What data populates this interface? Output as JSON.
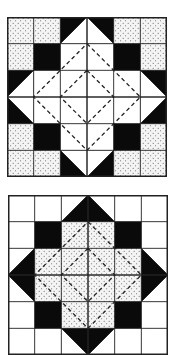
{
  "colors": {
    "black": "#0a0a0a",
    "white": "#ffffff",
    "dot_bg": "#f4f4f4",
    "dot": "#555555",
    "line": "#222222"
  },
  "blocks": [
    {
      "name": "quilt-block-top",
      "x": 7,
      "y": 17,
      "size": 160,
      "grid": 6,
      "corner_fill": "dot",
      "corner_inner": "black",
      "point_fill": "white",
      "point_bg": "black",
      "center_fill": "white"
    },
    {
      "name": "quilt-block-bottom",
      "x": 8,
      "y": 195,
      "size": 160,
      "grid": 6,
      "corner_fill": "white",
      "corner_inner": "black",
      "point_fill": "black",
      "point_bg": "white",
      "center_fill": "dot"
    }
  ]
}
